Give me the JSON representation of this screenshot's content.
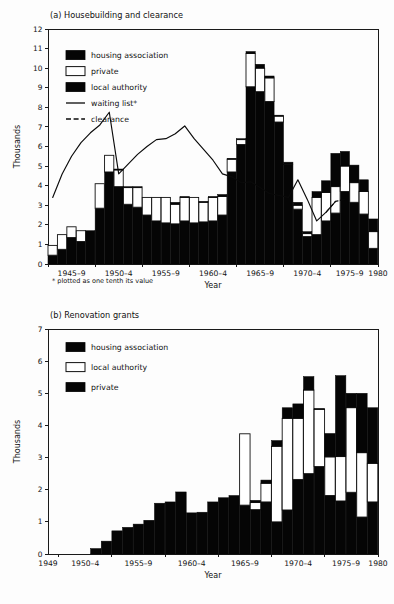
{
  "figure": {
    "panel_a_title": "(a) Housebuilding and clearance",
    "panel_b_title": "(b) Renovation grants",
    "footnote": "* plotted as one tenth its value",
    "y_axis_label": "Thousands",
    "x_axis_label": "Year",
    "ink_color": "#050505",
    "open_color": "#ffffff",
    "background": "#ffffff"
  },
  "chart_data": [
    {
      "id": "housebuilding-and-clearance",
      "type": "bar",
      "title": "(a) Housebuilding and clearance",
      "xlabel": "Year",
      "ylabel": "Thousands",
      "ylim": [
        0,
        12
      ],
      "yticks": [
        0,
        1,
        2,
        3,
        4,
        5,
        6,
        7,
        8,
        9,
        10,
        11,
        12
      ],
      "ytick_labels": [
        "0",
        "1",
        "2",
        "3",
        "4",
        "5",
        "6",
        "7",
        "8",
        "9",
        "10",
        "11",
        "12"
      ],
      "xlim": [
        1945,
        1980
      ],
      "xtick_labels": [
        "1945–9",
        "1950–4",
        "1955–9",
        "1960–4",
        "1965–9",
        "1970–4",
        "1975–9",
        "1980"
      ],
      "xtick_positions": [
        1947.5,
        1952.5,
        1957.5,
        1962.5,
        1967.5,
        1972.5,
        1977.0,
        1980.0
      ],
      "grid": false,
      "stacked": true,
      "legend_position": "upper-left",
      "legend": [
        {
          "label": "housing association",
          "swatch": "solid"
        },
        {
          "label": "private",
          "swatch": "open"
        },
        {
          "label": "local authority",
          "swatch": "solid"
        },
        {
          "label": "waiting list*",
          "swatch": "line"
        },
        {
          "label": "clearance",
          "swatch": "dashed-line"
        }
      ],
      "years": [
        1945,
        1946,
        1947,
        1948,
        1949,
        1950,
        1951,
        1952,
        1953,
        1954,
        1955,
        1956,
        1957,
        1958,
        1959,
        1960,
        1961,
        1962,
        1963,
        1964,
        1965,
        1966,
        1967,
        1968,
        1969,
        1970,
        1971,
        1972,
        1973,
        1974,
        1975,
        1976,
        1977,
        1978,
        1979
      ],
      "series": [
        {
          "name": "local authority",
          "swatch": "solid",
          "values": [
            0.45,
            0.75,
            1.35,
            1.15,
            1.7,
            2.85,
            4.7,
            3.95,
            3.05,
            2.9,
            2.5,
            2.2,
            2.1,
            2.05,
            2.2,
            2.1,
            2.15,
            2.2,
            2.5,
            4.7,
            6.1,
            9.05,
            8.8,
            8.3,
            7.25,
            5.1,
            2.8,
            1.4,
            1.5,
            2.2,
            2.6,
            3.7,
            3.15,
            2.55,
            0.8
          ]
        },
        {
          "name": "private",
          "swatch": "open",
          "values": [
            0.5,
            0.75,
            0.55,
            0.55,
            0.0,
            1.25,
            0.85,
            0.85,
            0.85,
            1.0,
            0.9,
            1.2,
            1.3,
            1.0,
            1.2,
            1.3,
            1.0,
            1.2,
            0.95,
            0.65,
            0.25,
            1.7,
            1.2,
            1.2,
            0.3,
            0.0,
            0.2,
            0.15,
            1.9,
            1.45,
            1.35,
            1.3,
            1.0,
            1.15,
            0.85
          ]
        },
        {
          "name": "housing association",
          "swatch": "solid",
          "values": [
            0.0,
            0.0,
            0.0,
            0.0,
            0.0,
            0.0,
            0.0,
            0.05,
            0.05,
            0.05,
            0.0,
            0.0,
            0.0,
            0.1,
            0.05,
            0.0,
            0.05,
            0.05,
            0.1,
            0.05,
            0.05,
            0.1,
            0.2,
            0.1,
            0.05,
            0.1,
            0.15,
            0.1,
            0.3,
            0.6,
            1.7,
            0.75,
            0.9,
            0.6,
            0.65
          ]
        }
      ],
      "lines": [
        {
          "name": "waiting list*",
          "style": "solid",
          "note": "plotted as one tenth its value",
          "x": [
            1945,
            1946,
            1947,
            1948,
            1949,
            1950,
            1951,
            1952,
            1953,
            1954,
            1955,
            1956,
            1957,
            1958,
            1959,
            1960,
            1961,
            1962,
            1963,
            1964,
            1965,
            1966,
            1967,
            1968,
            1969,
            1970,
            1971,
            1972,
            1973,
            1974,
            1975
          ],
          "y": [
            3.4,
            4.6,
            5.5,
            6.2,
            6.7,
            7.1,
            7.75,
            4.6,
            5.1,
            5.6,
            6.0,
            6.35,
            6.4,
            6.65,
            7.05,
            6.4,
            5.85,
            5.3,
            4.6,
            4.45,
            4.15,
            4.2,
            3.9,
            3.6,
            3.5,
            3.4,
            4.3,
            3.3,
            2.2,
            2.65,
            3.2
          ]
        },
        {
          "name": "clearance",
          "style": "dashed",
          "x": [
            1974,
            1975,
            1976
          ],
          "y": [
            2.65,
            3.2,
            3.3
          ]
        }
      ]
    },
    {
      "id": "renovation-grants",
      "type": "bar",
      "title": "(b) Renovation grants",
      "xlabel": "Year",
      "ylabel": "Thousands",
      "ylim": [
        0,
        7
      ],
      "yticks": [
        0,
        1,
        2,
        3,
        4,
        5,
        6,
        7
      ],
      "ytick_labels": [
        "0",
        "1",
        "2",
        "3",
        "4",
        "5",
        "6",
        "7"
      ],
      "xlim": [
        1949,
        1980
      ],
      "xtick_labels": [
        "1949",
        "1950–4",
        "1955–9",
        "1960–4",
        "1965–9",
        "1970–4",
        "1975–9",
        "1980"
      ],
      "xtick_positions": [
        1949.0,
        1952.5,
        1957.5,
        1962.5,
        1967.5,
        1972.5,
        1977.0,
        1980.0
      ],
      "grid": false,
      "stacked": true,
      "legend_position": "upper-left",
      "legend": [
        {
          "label": "housing association",
          "swatch": "solid"
        },
        {
          "label": "local authority",
          "swatch": "open"
        },
        {
          "label": "private",
          "swatch": "solid"
        }
      ],
      "years": [
        1949,
        1950,
        1951,
        1952,
        1953,
        1954,
        1955,
        1956,
        1957,
        1958,
        1959,
        1960,
        1961,
        1962,
        1963,
        1964,
        1965,
        1966,
        1967,
        1968,
        1969,
        1970,
        1971,
        1972,
        1973,
        1974,
        1975,
        1976,
        1977,
        1978,
        1979
      ],
      "series": [
        {
          "name": "private",
          "swatch": "solid",
          "values": [
            0.0,
            0.0,
            0.0,
            0.0,
            0.17,
            0.4,
            0.72,
            0.83,
            0.93,
            1.05,
            1.58,
            1.62,
            1.93,
            1.28,
            1.3,
            1.62,
            1.75,
            1.82,
            1.52,
            1.38,
            1.62,
            1.0,
            1.37,
            2.32,
            2.5,
            2.72,
            1.82,
            1.65,
            1.92,
            1.15,
            1.62
          ]
        },
        {
          "name": "local authority",
          "swatch": "open",
          "values": [
            0.0,
            0.0,
            0.0,
            0.0,
            0.0,
            0.0,
            0.0,
            0.0,
            0.0,
            0.0,
            0.0,
            0.0,
            0.0,
            0.0,
            0.0,
            0.0,
            0.0,
            0.0,
            2.22,
            0.22,
            0.58,
            2.35,
            2.85,
            1.9,
            2.6,
            1.78,
            1.2,
            1.38,
            2.63,
            2.0,
            1.2
          ]
        },
        {
          "name": "housing association",
          "swatch": "solid",
          "values": [
            0.0,
            0.0,
            0.0,
            0.0,
            0.0,
            0.0,
            0.0,
            0.0,
            0.0,
            0.0,
            0.0,
            0.0,
            0.0,
            0.0,
            0.0,
            0.0,
            0.0,
            0.0,
            0.0,
            0.07,
            0.1,
            0.18,
            0.33,
            0.45,
            0.42,
            0.03,
            0.73,
            2.52,
            0.45,
            1.85,
            1.73
          ]
        }
      ],
      "lines": []
    }
  ]
}
